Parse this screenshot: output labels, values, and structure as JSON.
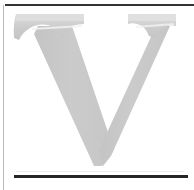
{
  "page": {
    "background_color": "#ffffff",
    "width": 194,
    "height": 190
  },
  "dropcap": {
    "letter": "V",
    "icon_name": "dropcap-letter-v",
    "style": "serif-capital",
    "fill_color": "#c9c9c9",
    "highlight_color": "#dcdcdc",
    "shadow_color": "#bdbdbd"
  },
  "rules": {
    "top_rule_color": "#333333",
    "left_rule_color": "#b8b8bd",
    "bottom_rule_color": "#262626",
    "ghost_rule_color": "#ededed"
  }
}
